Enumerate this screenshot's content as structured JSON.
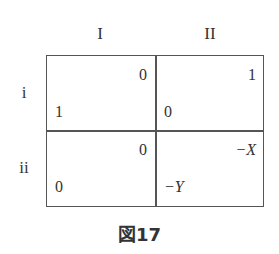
{
  "columns": [
    "I",
    "II"
  ],
  "rows": [
    "i",
    "ii"
  ],
  "payoffs": [
    [
      {
        "top_right": "0",
        "bottom_left": "1"
      },
      {
        "top_right": "1",
        "bottom_left": "0"
      }
    ],
    [
      {
        "top_right": "0",
        "bottom_left": "0"
      },
      {
        "top_right": "−X",
        "bottom_left": "−Y"
      }
    ]
  ],
  "caption": "図17"
}
